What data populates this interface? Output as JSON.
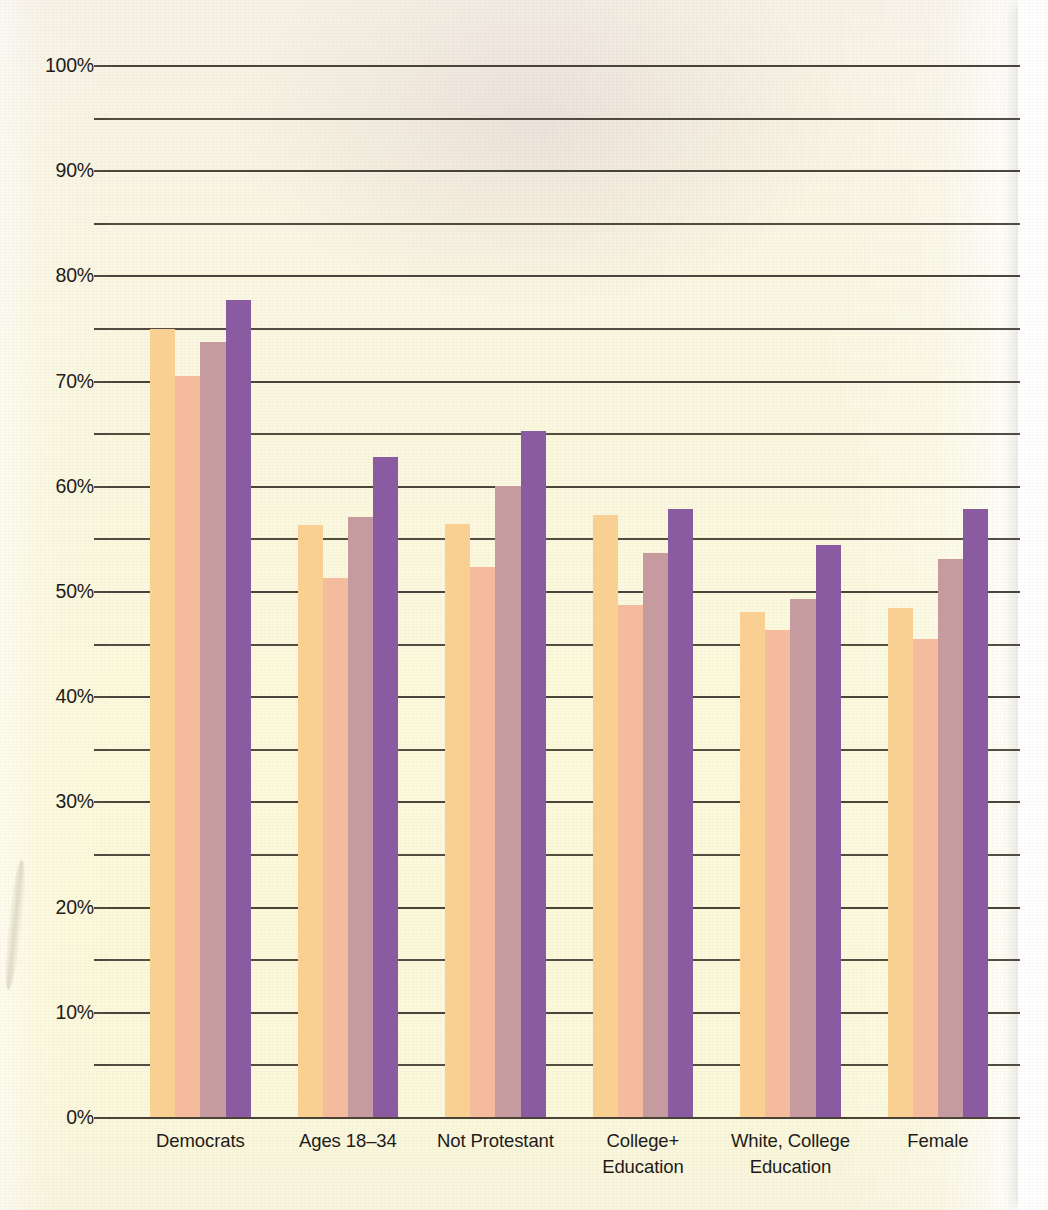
{
  "chart_data": {
    "type": "bar",
    "title": "",
    "subtitle": "",
    "xlabel": "",
    "ylabel": "",
    "ylim": [
      0,
      100
    ],
    "ytick_labels": [
      "0%",
      "10%",
      "20%",
      "30%",
      "40%",
      "50%",
      "60%",
      "70%",
      "80%",
      "90%",
      "100%"
    ],
    "ytick_values": [
      0,
      10,
      20,
      30,
      40,
      50,
      60,
      70,
      80,
      90,
      100
    ],
    "gridline_step": 5,
    "grid": true,
    "legend": "none",
    "legend_entries": [],
    "categories": [
      "Democrats",
      "Ages 18–34",
      "Not Protestant",
      "College+ Education",
      "White, College Education",
      "Female"
    ],
    "category_lines": [
      [
        "Democrats"
      ],
      [
        "Ages 18–34"
      ],
      [
        "Not Protestant"
      ],
      [
        "College+",
        "Education"
      ],
      [
        "White, College",
        "Education"
      ],
      [
        "Female"
      ]
    ],
    "series": [
      {
        "name": "Series 1",
        "color": "#f9cf92",
        "values": [
          74.9,
          56.3,
          56.4,
          57.2,
          48.0,
          48.4
        ]
      },
      {
        "name": "Series 2",
        "color": "#f4bb9c",
        "values": [
          70.4,
          51.2,
          52.3,
          48.7,
          46.3,
          45.4
        ]
      },
      {
        "name": "Series 3",
        "color": "#c59ba0",
        "values": [
          73.7,
          57.0,
          60.0,
          53.6,
          49.2,
          53.0
        ]
      },
      {
        "name": "Series 4",
        "color": "#8a5ba0",
        "values": [
          77.7,
          62.7,
          65.2,
          57.8,
          54.4,
          57.8
        ]
      }
    ]
  },
  "axis": {
    "y_max_label": "100%",
    "y_min_label": "0%"
  }
}
